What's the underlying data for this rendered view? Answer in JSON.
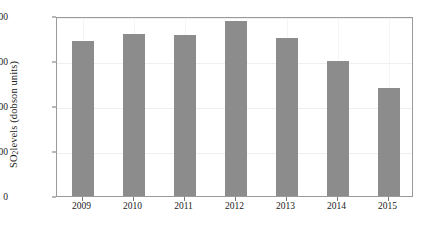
{
  "chart_data": {
    "type": "bar",
    "title": "",
    "xlabel": "",
    "ylabel": "SO2 levels (dobson units)",
    "ylabel_parts": {
      "pre": "SO",
      "sub": "2",
      "post": " levels (dobson units)"
    },
    "categories": [
      "2009",
      "2010",
      "2011",
      "2012",
      "2013",
      "2014",
      "2015"
    ],
    "values": [
      3450,
      3600,
      3580,
      3900,
      3520,
      3010,
      2400
    ],
    "series": [
      {
        "name": "SO2 levels",
        "values": [
          3450,
          3600,
          3580,
          3900,
          3520,
          3010,
          2400
        ]
      }
    ],
    "ylim": [
      0,
      4000
    ],
    "yticks": [
      0,
      1000,
      2000,
      3000,
      4000
    ],
    "ytick_labels": [
      "0",
      "1000",
      "2000",
      "3000",
      "4000"
    ],
    "xtick_labels": [
      "2009",
      "2010",
      "2011",
      "2012",
      "2013",
      "2014",
      "2015"
    ],
    "grid": true,
    "legend": "none",
    "bar_color": "#8c8c8c",
    "frame_color": "#9a9a9a",
    "grid_color": "#efefef",
    "background": "#ffffff"
  }
}
